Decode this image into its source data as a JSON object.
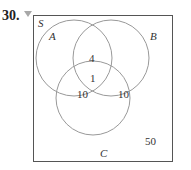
{
  "problem": {
    "number": "30.",
    "marker_icon": "triangle-down"
  },
  "venn": {
    "universe_label": "S",
    "sets": [
      {
        "label": "A"
      },
      {
        "label": "B"
      },
      {
        "label": "C"
      }
    ],
    "regions": {
      "A_and_B_only": "4",
      "A_and_B_and_C": "1",
      "A_and_C_only": "10",
      "B_and_C_only": "10",
      "outside": "50"
    },
    "colors": {
      "stroke": "#999999",
      "box": "#555555",
      "text": "#333333"
    }
  }
}
